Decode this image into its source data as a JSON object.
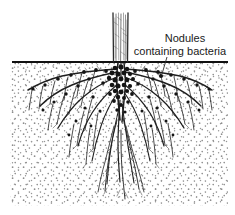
{
  "figure": {
    "name": "legume-root-nodules-diagram",
    "type": "botanical-line-illustration",
    "width": 235,
    "height": 215,
    "background_color": "#ffffff"
  },
  "annotation": {
    "line1": "Nodules",
    "line2": "containing bacteria",
    "text_color": "#1a1a1a",
    "line1_x": 185,
    "line1_y": 42,
    "line2_x": 180,
    "line2_y": 55,
    "leader": {
      "from_x": 167,
      "from_y": 57,
      "to_x": 162,
      "to_y": 74,
      "color": "#2a2a2a"
    }
  },
  "ground_line": {
    "label": "soil-surface-line",
    "x_start": 12,
    "x_end": 228,
    "y": 62,
    "color": "#111111",
    "thickness": 2
  },
  "soil": {
    "label": "stippled-soil-cross-section",
    "x_start": 10,
    "x_end": 228,
    "y_start": 63,
    "y_end": 206,
    "stipple_color": "#8d8d8d",
    "background_color": "#ffffff"
  },
  "stem": {
    "label": "plant-stem",
    "x_left": 112,
    "x_right": 129,
    "y_top": 13,
    "y_bottom": 63,
    "ink_color": "#2b2b2b"
  },
  "roots": {
    "label": "root-system",
    "ink_color": "#1f1f1f",
    "crown_x": 120,
    "crown_y": 68,
    "max_depth_y": 200,
    "spread_x_left": 22,
    "spread_x_right": 214
  },
  "nodules": {
    "label": "root-nodules",
    "color": "#141414",
    "description": "dark rounded nodules clustered on the crown and along lateral roots"
  }
}
